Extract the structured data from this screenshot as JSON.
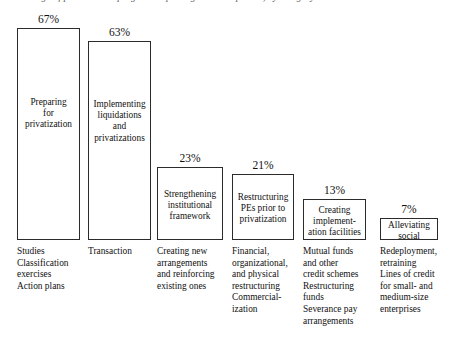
{
  "figure": {
    "top_cropped_caption": "Percentage of privatization programs reporting each component, by category",
    "baseline_y_px": 240
  },
  "chart_data": {
    "type": "bar",
    "title": "",
    "subtitle": "",
    "xlabel": "",
    "ylabel": "",
    "ylim": [
      0,
      72
    ],
    "grid": false,
    "legend": "none",
    "value_suffix": "%",
    "categories": [
      "Preparing for privatization",
      "Implementing liquidations and privatizations",
      "Strengthening institutional framework",
      "Restructuring PEs prior to privatization",
      "Creating implementation facilities",
      "Alleviating social impact"
    ],
    "values": [
      67,
      63,
      23,
      21,
      13,
      7
    ],
    "bars": [
      {
        "value_label": "67%",
        "value": 67,
        "in_bar_label": "Preparing\nfor\nprivatization",
        "footnote_marker": "",
        "caption": "Studies\nClassification\nexercises\nAction plans",
        "x_px": 17,
        "width_px": 63
      },
      {
        "value_label": "63%",
        "value": 63,
        "in_bar_label": "Implementing\nliquidations\nand\nprivatizations",
        "footnote_marker": "",
        "caption": "Transaction",
        "x_px": 88,
        "width_px": 63
      },
      {
        "value_label": "23%",
        "value": 23,
        "in_bar_label": "Strengthening\ninstitutional\nframework",
        "footnote_marker": "",
        "caption": "Creating new\narrangements\nand reinforcing\nexisting ones",
        "x_px": 157,
        "width_px": 66
      },
      {
        "value_label": "21%",
        "value": 21,
        "in_bar_label": "Restructuring\nPEs prior to\nprivatization",
        "footnote_marker": "",
        "caption": "Financial,\norganizational,\nand physical\nrestructuring\nCommercial-\nization",
        "x_px": 232,
        "width_px": 62
      },
      {
        "value_label": "13%",
        "value": 13,
        "in_bar_label": "Creating\nimplement-\nation facilities",
        "footnote_marker": "",
        "caption": "Mutual funds\nand other\ncredit schemes\nRestructuring\nfunds\nSeverance pay\narrangements",
        "x_px": 303,
        "width_px": 63
      },
      {
        "value_label": "7%",
        "value": 7,
        "in_bar_label": "Alleviating\nsocial impact",
        "footnote_marker": "a",
        "caption": "Redeployment,\nretraining\nLines of credit\nfor small- and\nmedium-size\nenterprises",
        "x_px": 380,
        "width_px": 58
      }
    ]
  },
  "colors": {
    "bar_border": "#2b2b2b",
    "bar_fill": "#ffffff",
    "text": "#111111",
    "background": "#ffffff"
  }
}
